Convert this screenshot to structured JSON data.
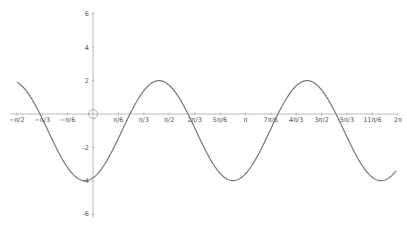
{
  "chart_data": {
    "type": "line",
    "title": "",
    "xlabel": "",
    "ylabel": "",
    "grid": false,
    "xlim": [
      -1.5708,
      6.2832
    ],
    "ylim": [
      -6,
      6
    ],
    "x_tick_labels": [
      "−π/2",
      "−π/3",
      "−π/6",
      "π/6",
      "π/3",
      "π/2",
      "2π/3",
      "5π/6",
      "π",
      "7π/6",
      "4π/3",
      "3π/2",
      "5π/3",
      "11π/6",
      "2π"
    ],
    "y_tick_labels": [
      "6",
      "4",
      "2",
      "-2",
      "-4",
      "-6"
    ],
    "series": [
      {
        "name": "f(x)",
        "color": "#777777",
        "expression": "y = 3·sin(2x − 0.46π)... approx; max 2, min −4, period π",
        "x": [
          -1.5708,
          -1.0472,
          -0.5236,
          -0.1571,
          0,
          0.5236,
          1.0472,
          1.4137,
          1.5708,
          2.0944,
          2.618,
          2.985,
          3.1416,
          3.6652,
          4.1888,
          4.5553,
          4.7124,
          5.236,
          5.7596,
          6.1261,
          6.2832
        ],
        "values": [
          1.6,
          -1.3,
          -3.6,
          -4.0,
          -3.7,
          -0.5,
          1.6,
          2.0,
          1.9,
          -0.6,
          -3.5,
          -4.0,
          -3.8,
          -1.0,
          1.6,
          2.0,
          1.9,
          -0.6,
          -3.5,
          -4.0,
          -3.7
        ]
      }
    ]
  },
  "colors": {
    "axis": "#999999",
    "curve": "#777777",
    "label": "#555555"
  }
}
